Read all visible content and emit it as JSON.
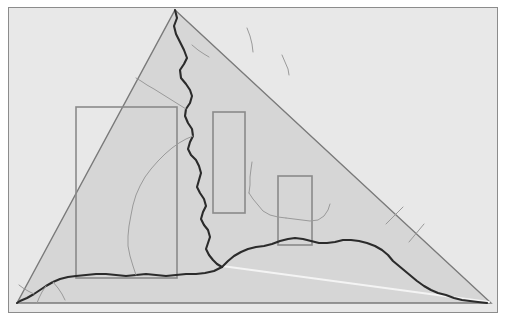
{
  "figure": {
    "title": "",
    "type": "fracture-simulation-diagram",
    "canvas": {
      "width": 506,
      "height": 320
    },
    "colors": {
      "page_background": "#ffffff",
      "panel_background": "#d6d6d6",
      "outside_background": "#e8e8e8",
      "panel_border": "#8c8c8c",
      "crack_primary": "#2b2b2b",
      "crack_secondary": "#9a9a9a",
      "triangle_edge": "#7a7a7a",
      "rect_outline": "#8a8a8a",
      "highlight_line": "#f4f4f4"
    },
    "panel": {
      "x": 8,
      "y": 7,
      "width": 490,
      "height": 306,
      "border_width": 1
    },
    "triangle": {
      "label": "specimen-triangle",
      "apex": {
        "x": 175,
        "y": 10
      },
      "bottom_left": {
        "x": 17,
        "y": 303
      },
      "bottom_right": {
        "x": 491,
        "y": 303
      },
      "stroke_width": 1.4
    },
    "highlight_line": {
      "label": "bright-ligament-line",
      "from": {
        "x": 222,
        "y": 266
      },
      "to": {
        "x": 489,
        "y": 302
      },
      "stroke_width": 2
    },
    "rectangles": [
      {
        "name": "region-large-left",
        "x": 76,
        "y": 107,
        "width": 101,
        "height": 171
      },
      {
        "name": "region-tall-middle",
        "x": 213,
        "y": 112,
        "width": 32,
        "height": 101
      },
      {
        "name": "region-small-right",
        "x": 278,
        "y": 176,
        "width": 34,
        "height": 69
      }
    ],
    "crack_paths": [
      {
        "name": "main-crack-vertical",
        "style": "primary",
        "points": "175,10 177,18 174,26 176,34 180,42 184,50 187,58 184,64 180,70 181,78 186,84 190,90 192,96 190,103 186,109 185,116 188,123 192,129 193,136 190,142 188,149 191,155 196,160 199,166 201,173 199,180 197,187 200,193 204,199 206,206 203,212 201,219 204,225 208,230 210,237 208,243 206,249 209,255 213,260 217,264 222,267"
      },
      {
        "name": "main-crack-horizontal-left",
        "style": "primary",
        "points": "222,267 214,271 205,273 196,274 186,274 176,275 166,276 156,275 146,274 136,275 126,276 116,275 106,274 96,274 86,275 76,276 68,277 60,279 53,282 46,286 40,290 34,294 27,298 20,301 17,303"
      },
      {
        "name": "main-crack-horizontal-right",
        "style": "primary",
        "points": "222,267 228,261 234,256 241,252 248,249 256,247 264,246 272,244 280,241 288,239 295,238 303,239 311,241 319,243 327,243 335,242 343,240 351,240 359,241 367,243 375,246 382,250 388,255 393,261 399,266 405,271 411,276 417,281 424,286 431,290 438,293 446,295 454,298 462,300 470,301 478,302 487,303"
      },
      {
        "name": "branch-crack-upper-left",
        "style": "secondary",
        "points": "186,109 178,104 170,99 162,94 154,89 147,85 141,81 136,78"
      },
      {
        "name": "branch-crack-mid-left",
        "style": "secondary",
        "points": "193,136 186,139 179,143 172,148 165,154 158,161 151,169 145,177 140,186 136,195 133,205 131,215 129,226 128,236 128,246 130,256 133,266 136,275"
      },
      {
        "name": "branch-crack-upper-right-a",
        "style": "secondary",
        "points": "192,45 198,50 204,54 209,57"
      },
      {
        "name": "branch-crack-upper-right-b",
        "style": "secondary",
        "points": "247,28 250,36 252,44 253,52"
      },
      {
        "name": "branch-crack-upper-right-c",
        "style": "secondary",
        "points": "282,55 285,62 288,69 289,75"
      },
      {
        "name": "branch-crack-right-stem-a",
        "style": "secondary",
        "points": "249,193 253,199 258,205 263,211 270,215 278,217 286,218"
      },
      {
        "name": "branch-crack-right-stem-b",
        "style": "secondary",
        "points": "249,193 250,185 250,177 251,169 252,162"
      },
      {
        "name": "branch-crack-right-stem-c",
        "style": "secondary",
        "points": "286,218 294,219 302,220 310,221 318,220 324,216 328,210 330,204"
      },
      {
        "name": "branch-crack-far-right-a",
        "style": "secondary",
        "points": "386,224 392,218 398,212 403,207"
      },
      {
        "name": "branch-crack-far-right-b",
        "style": "secondary",
        "points": "409,242 414,236 419,230 424,224"
      },
      {
        "name": "branch-crack-bottom-left-a",
        "style": "secondary",
        "points": "46,286 42,292 39,298 37,303"
      },
      {
        "name": "branch-crack-bottom-left-b",
        "style": "secondary",
        "points": "53,282 58,288 62,294 65,300"
      },
      {
        "name": "branch-crack-bottom-left-c",
        "style": "secondary",
        "points": "34,294 28,291 23,288 19,285"
      }
    ]
  }
}
